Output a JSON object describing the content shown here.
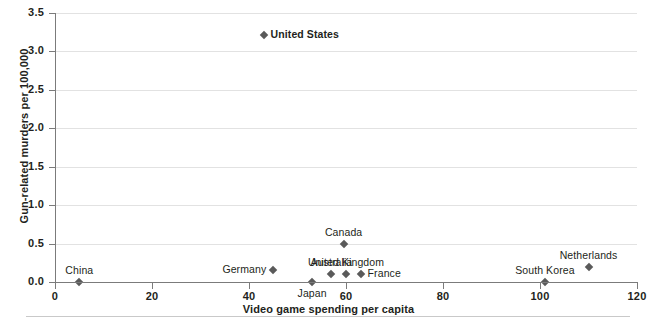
{
  "chart_data": {
    "type": "scatter",
    "title": "",
    "xlabel": "Video game spending per capita",
    "ylabel": "Gun-related murders per 100,000",
    "xlim": [
      0,
      120
    ],
    "ylim": [
      0.0,
      3.5
    ],
    "xticks": [
      "0",
      "20",
      "40",
      "60",
      "80",
      "100",
      "120"
    ],
    "xtick_values": [
      0,
      20,
      40,
      60,
      80,
      100,
      120
    ],
    "yticks": [
      "0.0",
      "0.5",
      "1.0",
      "1.5",
      "2.0",
      "2.5",
      "3.0",
      "3.5"
    ],
    "ytick_values": [
      0.0,
      0.5,
      1.0,
      1.5,
      2.0,
      2.5,
      3.0,
      3.5
    ],
    "grid": "horizontal",
    "legend": "none",
    "marker": "diamond",
    "marker_color": "#5a5a5a",
    "gridline_color": "#e2e2e2",
    "axis_color": "#7b7b7b",
    "points": [
      {
        "label": "China",
        "x": 5,
        "y": 0.0,
        "label_pos": "above",
        "bold": false
      },
      {
        "label": "Germany",
        "x": 45,
        "y": 0.16,
        "label_pos": "left",
        "bold": false
      },
      {
        "label": "United States",
        "x": 43,
        "y": 3.21,
        "label_pos": "right",
        "bold": true
      },
      {
        "label": "Japan",
        "x": 53,
        "y": 0.0,
        "label_pos": "below",
        "bold": false
      },
      {
        "label": "Australia",
        "x": 57,
        "y": 0.1,
        "label_pos": "above",
        "bold": false
      },
      {
        "label": "Canada",
        "x": 59.5,
        "y": 0.5,
        "label_pos": "above",
        "bold": false
      },
      {
        "label": "United Kingdom",
        "x": 60,
        "y": 0.1,
        "label_pos": "above",
        "bold": false
      },
      {
        "label": "France",
        "x": 63,
        "y": 0.1,
        "label_pos": "right",
        "bold": false
      },
      {
        "label": "South Korea",
        "x": 101,
        "y": 0.0,
        "label_pos": "above",
        "bold": false
      },
      {
        "label": "Netherlands",
        "x": 110,
        "y": 0.2,
        "label_pos": "above",
        "bold": false
      }
    ]
  }
}
